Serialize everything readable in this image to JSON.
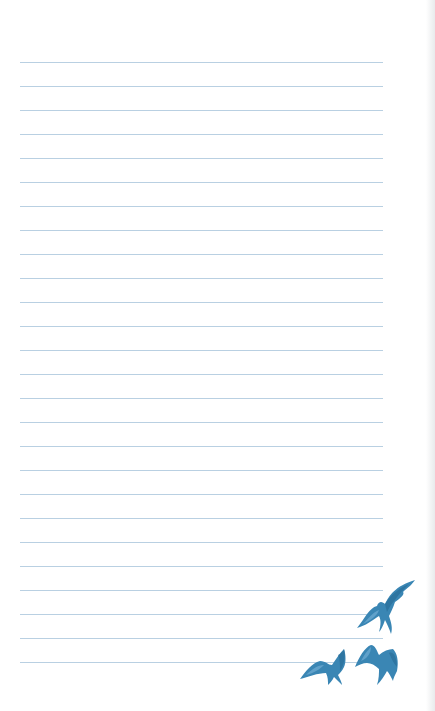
{
  "page": {
    "type": "lined-notepaper",
    "background": "#ffffff",
    "line_color": "#b9d0e2",
    "line_count": 26,
    "first_line_y": 62,
    "line_spacing": 24,
    "line_left": 20,
    "line_width": 363
  },
  "decorations": {
    "bird_color": "#3a86b4",
    "bird_shade": "#2a6d99",
    "birds": [
      {
        "name": "bird-flying-upper",
        "x": 355,
        "y": 578,
        "w": 62,
        "h": 56
      },
      {
        "name": "bird-flying-lower-left",
        "x": 298,
        "y": 645,
        "w": 54,
        "h": 40
      },
      {
        "name": "bird-flying-lower-right",
        "x": 353,
        "y": 643,
        "w": 47,
        "h": 42
      }
    ]
  }
}
